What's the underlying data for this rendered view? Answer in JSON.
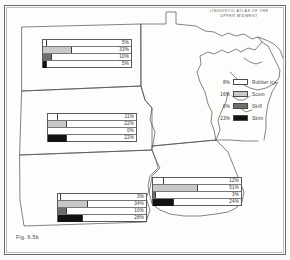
{
  "figure": {
    "atlas_title_line1": "LINGUISTIC ATLAS OF THE",
    "atlas_title_line2": "UPPER MIDWEST",
    "caption": "Fig. 6.5b"
  },
  "legend": {
    "items": [
      {
        "pct": "8%",
        "label": "Rubber ice",
        "fill": "f-rubber",
        "color": "#ffffff"
      },
      {
        "pct": "16%",
        "label": "Scum",
        "fill": "f-scum",
        "color": "#c9c9c9"
      },
      {
        "pct": "6%",
        "label": "Skiff",
        "fill": "f-skiff",
        "color": "#6e6e6e"
      },
      {
        "pct": "23%",
        "label": "Skim",
        "fill": "f-skim",
        "color": "#121212"
      }
    ]
  },
  "chart_data": {
    "type": "bar",
    "title": "LINGUISTIC ATLAS OF THE UPPER MIDWEST",
    "subtitle": "Fig. 6.5b",
    "categories": [
      "Rubber ice",
      "Scum",
      "Skiff",
      "Skim"
    ],
    "xlabel": "",
    "ylabel": "Percent of informants",
    "xlim": [
      0,
      100
    ],
    "grid": false,
    "legend_position": "right",
    "note": "One small horizontal bar chart is placed over each state on the map; bar length is percent of informants using the term.",
    "panels": [
      {
        "state": "North Dakota",
        "values": [
          5,
          33,
          10,
          5
        ],
        "labels": [
          "5%",
          "33%",
          "10%",
          "5%"
        ]
      },
      {
        "state": "South Dakota",
        "values": [
          11,
          22,
          0,
          22
        ],
        "labels": [
          "11%",
          "22%",
          "0%",
          "22%"
        ]
      },
      {
        "state": "Nebraska",
        "values": [
          3,
          34,
          10,
          28
        ],
        "labels": [
          "3%",
          "34%",
          "10%",
          "28%"
        ]
      },
      {
        "state": "Iowa",
        "values": [
          12,
          51,
          3,
          24
        ],
        "labels": [
          "12%",
          "51%",
          "3%",
          "24%"
        ]
      },
      {
        "state": "Legend (regional total)",
        "values": [
          8,
          16,
          6,
          23
        ],
        "labels": [
          "8%",
          "16%",
          "6%",
          "23%"
        ]
      }
    ]
  },
  "charts": {
    "nd": {
      "rows": [
        {
          "pct": "5%",
          "w": 5,
          "fill": "f-rubber"
        },
        {
          "pct": "33%",
          "w": 33,
          "fill": "f-scum"
        },
        {
          "pct": "10%",
          "w": 10,
          "fill": "f-skiff"
        },
        {
          "pct": "5%",
          "w": 5,
          "fill": "f-skim"
        }
      ]
    },
    "sd": {
      "rows": [
        {
          "pct": "11%",
          "w": 11,
          "fill": "f-rubber"
        },
        {
          "pct": "22%",
          "w": 22,
          "fill": "f-scum"
        },
        {
          "pct": "0%",
          "w": 0,
          "fill": "f-skiff"
        },
        {
          "pct": "22%",
          "w": 22,
          "fill": "f-skim"
        }
      ]
    },
    "ne": {
      "rows": [
        {
          "pct": "3%",
          "w": 3,
          "fill": "f-rubber"
        },
        {
          "pct": "34%",
          "w": 34,
          "fill": "f-scum"
        },
        {
          "pct": "10%",
          "w": 10,
          "fill": "f-skiff"
        },
        {
          "pct": "28%",
          "w": 28,
          "fill": "f-skim"
        }
      ]
    },
    "ia": {
      "rows": [
        {
          "pct": "12%",
          "w": 12,
          "fill": "f-rubber"
        },
        {
          "pct": "51%",
          "w": 51,
          "fill": "f-scum"
        },
        {
          "pct": "3%",
          "w": 3,
          "fill": "f-skiff"
        },
        {
          "pct": "24%",
          "w": 24,
          "fill": "f-skim"
        }
      ]
    }
  }
}
